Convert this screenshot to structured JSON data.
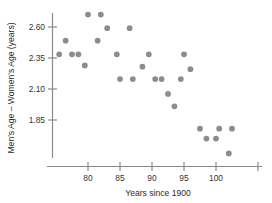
{
  "chart_data": {
    "type": "scatter",
    "title": "",
    "xlabel": "Years since 1900",
    "ylabel": "Men's Age – Women's Age (years)",
    "xlim": [
      74.5,
      104.5
    ],
    "ylim": [
      1.5,
      2.76
    ],
    "grid": false,
    "legend": null,
    "xticks": [
      80,
      85,
      90,
      95,
      100
    ],
    "xtick_labels": [
      "80",
      "85",
      "90",
      "95",
      "100"
    ],
    "yticks": [
      1.85,
      2.1,
      2.35,
      2.6
    ],
    "ytick_labels": [
      "1.85",
      "2.10",
      "2.35",
      "2.60"
    ],
    "marker": {
      "shape": "circle",
      "color": "#8c8c8c",
      "size": 4.6
    },
    "points": [
      {
        "x": 75.5,
        "y": 2.38
      },
      {
        "x": 76.5,
        "y": 2.49
      },
      {
        "x": 77.5,
        "y": 2.38
      },
      {
        "x": 78.5,
        "y": 2.38
      },
      {
        "x": 79.5,
        "y": 2.29
      },
      {
        "x": 80.0,
        "y": 2.7
      },
      {
        "x": 81.5,
        "y": 2.49
      },
      {
        "x": 82.0,
        "y": 2.7
      },
      {
        "x": 83.0,
        "y": 2.59
      },
      {
        "x": 84.5,
        "y": 2.38
      },
      {
        "x": 85.0,
        "y": 2.18
      },
      {
        "x": 86.5,
        "y": 2.59
      },
      {
        "x": 87.0,
        "y": 2.18
      },
      {
        "x": 88.5,
        "y": 2.28
      },
      {
        "x": 89.5,
        "y": 2.38
      },
      {
        "x": 90.5,
        "y": 2.18
      },
      {
        "x": 91.5,
        "y": 2.18
      },
      {
        "x": 92.5,
        "y": 2.06
      },
      {
        "x": 93.5,
        "y": 1.96
      },
      {
        "x": 94.5,
        "y": 2.18
      },
      {
        "x": 95.0,
        "y": 2.38
      },
      {
        "x": 96.0,
        "y": 2.26
      },
      {
        "x": 97.5,
        "y": 1.78
      },
      {
        "x": 98.5,
        "y": 1.7
      },
      {
        "x": 100.0,
        "y": 1.7
      },
      {
        "x": 100.5,
        "y": 1.78
      },
      {
        "x": 102.0,
        "y": 1.58
      },
      {
        "x": 102.5,
        "y": 1.78
      }
    ]
  },
  "colors": {
    "marker": "#8c8c8c",
    "axis": "#8a8a8a",
    "text": "#2b2b2b",
    "background": "#ffffff"
  }
}
